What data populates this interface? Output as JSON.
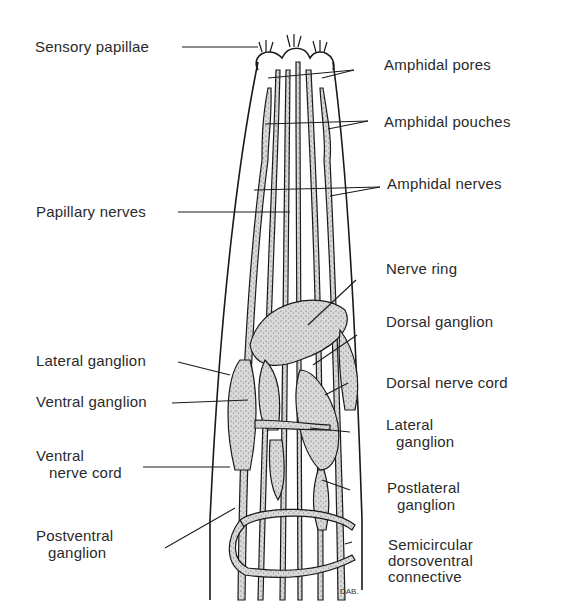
{
  "figure": {
    "signature": "DAB",
    "labels": {
      "sensory_papillae": "Sensory papillae",
      "amphidal_pores": "Amphidal pores",
      "amphidal_pouches": "Amphidal pouches",
      "amphidal_nerves": "Amphidal nerves",
      "papillary_nerves": "Papillary nerves",
      "nerve_ring": "Nerve ring",
      "dorsal_ganglion": "Dorsal ganglion",
      "lateral_ganglion_left": "Lateral ganglion",
      "dorsal_nerve_cord": "Dorsal nerve cord",
      "ventral_ganglion": "Ventral ganglion",
      "lateral_ganglion_right_l1": "Lateral",
      "lateral_ganglion_right_l2": "ganglion",
      "ventral_nerve_cord_l1": "Ventral",
      "ventral_nerve_cord_l2": "nerve cord",
      "postlateral_ganglion_l1": "Postlateral",
      "postlateral_ganglion_l2": "ganglion",
      "postventral_ganglion_l1": "Postventral",
      "postventral_ganglion_l2": "ganglion",
      "semicircular_l1": "Semicircular",
      "semicircular_l2": "dorsoventral",
      "semicircular_l3": "connective"
    }
  }
}
